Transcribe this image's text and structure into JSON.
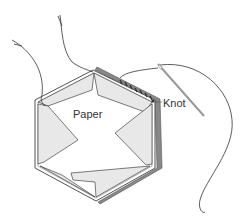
{
  "diagram": {
    "labels": {
      "paper": "Paper",
      "knot": "Knot"
    },
    "colors": {
      "fabric_fold": "#e6e6e6",
      "fabric_edge": "#888888",
      "outline": "#444444",
      "thread": "#333333",
      "needle": "#999999"
    }
  }
}
